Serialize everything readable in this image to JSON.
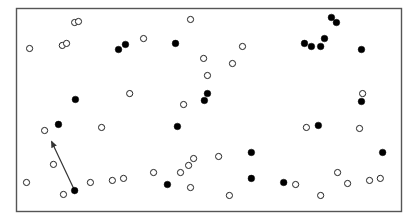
{
  "chart_data": {
    "type": "scatter",
    "title": "",
    "xlabel": "",
    "ylabel": "",
    "xlim": [
      0,
      100
    ],
    "ylim": [
      0,
      100
    ],
    "grid": false,
    "legend": null,
    "colors": {
      "frame": "#555555",
      "marker_edge": "#222222",
      "filled": "#000000",
      "hollow": "#ffffff",
      "arrow": "#333333"
    },
    "series": [
      {
        "name": "hollow",
        "style": "hollow",
        "points": [
          [
            3.4,
            80.3
          ],
          [
            15.1,
            93.1
          ],
          [
            16.1,
            93.6
          ],
          [
            11.9,
            81.8
          ],
          [
            13.0,
            82.8
          ],
          [
            45.2,
            94.6
          ],
          [
            33.0,
            85.2
          ],
          [
            48.6,
            75.4
          ],
          [
            58.7,
            81.3
          ],
          [
            56.1,
            72.9
          ],
          [
            49.6,
            67.0
          ],
          [
            43.4,
            52.7
          ],
          [
            29.4,
            58.1
          ],
          [
            7.3,
            39.9
          ],
          [
            22.1,
            41.4
          ],
          [
            9.6,
            23.2
          ],
          [
            2.6,
            14.3
          ],
          [
            12.2,
            8.4
          ],
          [
            19.2,
            14.3
          ],
          [
            24.9,
            15.3
          ],
          [
            27.8,
            16.3
          ],
          [
            35.6,
            19.2
          ],
          [
            42.6,
            19.2
          ],
          [
            44.7,
            22.7
          ],
          [
            46.0,
            26.1
          ],
          [
            52.5,
            27.1
          ],
          [
            45.2,
            11.8
          ],
          [
            55.3,
            7.9
          ],
          [
            72.5,
            13.3
          ],
          [
            79.0,
            7.9
          ],
          [
            83.4,
            19.2
          ],
          [
            86.0,
            13.8
          ],
          [
            91.7,
            15.3
          ],
          [
            94.5,
            16.3
          ],
          [
            75.3,
            41.4
          ],
          [
            89.1,
            40.9
          ],
          [
            89.9,
            58.1
          ]
        ]
      },
      {
        "name": "filled",
        "style": "filled",
        "points": [
          [
            26.5,
            79.8
          ],
          [
            28.3,
            82.3
          ],
          [
            41.3,
            82.8
          ],
          [
            15.3,
            55.2
          ],
          [
            10.9,
            42.9
          ],
          [
            49.6,
            58.1
          ],
          [
            48.8,
            54.7
          ],
          [
            41.8,
            41.9
          ],
          [
            15.1,
            10.3
          ],
          [
            39.2,
            13.3
          ],
          [
            61.0,
            29.1
          ],
          [
            61.0,
            16.3
          ],
          [
            69.4,
            14.3
          ],
          [
            81.8,
            95.6
          ],
          [
            83.1,
            93.1
          ],
          [
            74.8,
            82.8
          ],
          [
            76.6,
            81.3
          ],
          [
            79.0,
            81.3
          ],
          [
            80.0,
            85.2
          ],
          [
            89.6,
            79.8
          ],
          [
            89.6,
            54.2
          ],
          [
            78.4,
            42.4
          ],
          [
            95.1,
            29.1
          ]
        ]
      }
    ],
    "annotations": [
      {
        "type": "arrow",
        "from": [
          15.1,
          10.3
        ],
        "to": [
          9.1,
          34.5
        ]
      }
    ]
  }
}
